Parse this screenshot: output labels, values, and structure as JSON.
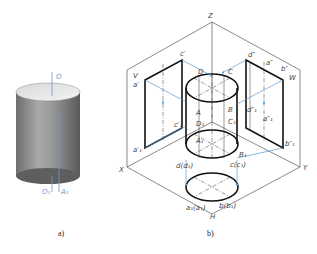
{
  "figure_a": {
    "caption": "a)",
    "labels": {
      "top_axis": "O",
      "bottom_axis": "O₁",
      "bottom_point": "A₁"
    },
    "axis_color": "#6a9cc9"
  },
  "figure_b": {
    "caption": "b)",
    "axes": {
      "z": "Z",
      "x": "X",
      "y": "Y",
      "h": "H"
    },
    "planes": {
      "v": "V",
      "w": "W"
    },
    "cylinder_points": {
      "a": "A",
      "b": "B",
      "c": "C",
      "d": "D",
      "a1": "A₁",
      "b1": "B₁",
      "c1": "C₁",
      "d1": "D₁"
    },
    "front_view": {
      "a": "a′",
      "c": "c′",
      "a1": "a′₁",
      "c1": "c′₁"
    },
    "side_view": {
      "d": "d″",
      "a": "a″",
      "b": "b″",
      "d1": "d″₁",
      "a1": "a″₁",
      "b1": "b″₁"
    },
    "top_view": {
      "d": "d(d₁)",
      "c": "c(c₁)",
      "a": "a₁(a₁)",
      "b": "b(b₁)"
    },
    "projection_color": "#5b9bd5"
  }
}
